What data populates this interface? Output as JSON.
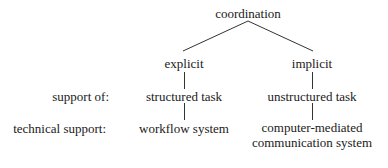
{
  "diagram": {
    "root": {
      "label": "coordination"
    },
    "branches": [
      {
        "label": "explicit",
        "task": "structured task",
        "technical_support": [
          "workflow system"
        ]
      },
      {
        "label": "implicit",
        "task": "unstructured task",
        "technical_support": [
          "computer-mediated",
          "communication system"
        ]
      }
    ],
    "row_labels": {
      "support_of": "support of:",
      "technical_support": "technical support:"
    },
    "colors": {
      "line": "#333333",
      "text": "#1a1a1a",
      "background": "#ffffff"
    }
  }
}
